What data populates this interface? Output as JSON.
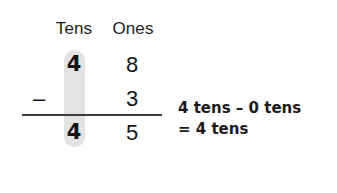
{
  "worksheet": {
    "columns": {
      "tens_header": "Tens",
      "ones_header": "Ones"
    },
    "problem": {
      "minuend": {
        "tens": "4",
        "ones": "8"
      },
      "subtrahend": {
        "tens": "",
        "ones": "3"
      },
      "operator": "–",
      "result": {
        "tens": "4",
        "ones": "5"
      }
    },
    "explanation": {
      "line1": "4 tens – 0 tens",
      "line2": "= 4 tens"
    },
    "colors": {
      "highlight": "#e2e2e2",
      "rule": "#3b3b3b",
      "text": "#1a1a1a",
      "background": "#ffffff"
    }
  }
}
